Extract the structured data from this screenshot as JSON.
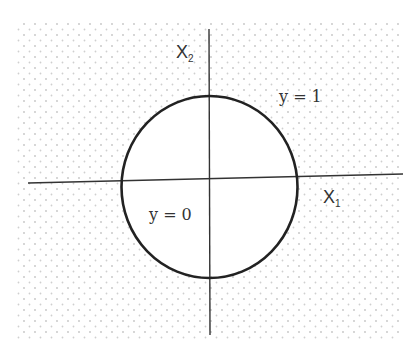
{
  "diagram": {
    "type": "decision-boundary",
    "colors": {
      "background": "#ffffff",
      "dot_pattern": "#c8c8c8",
      "lines": "#222222",
      "text": "#333333"
    },
    "axes": {
      "x": {
        "label": "X",
        "subscript": "1"
      },
      "y": {
        "label": "X",
        "subscript": "2"
      }
    },
    "regions": {
      "outside": {
        "label": "y = 1"
      },
      "inside": {
        "label": "y = 0"
      }
    },
    "boundary": {
      "shape": "circle",
      "center": [
        209,
        187
      ],
      "radius": 90
    }
  }
}
